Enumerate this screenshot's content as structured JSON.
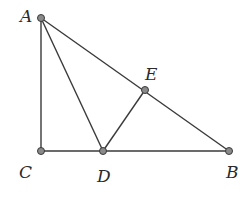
{
  "figure": {
    "type": "geometry-triangle",
    "points": [
      {
        "id": "A",
        "label": "A",
        "x": 41,
        "y": 18,
        "label_x": 20,
        "label_y": 22
      },
      {
        "id": "C",
        "label": "C",
        "x": 41,
        "y": 151,
        "label_x": 19,
        "label_y": 178
      },
      {
        "id": "D",
        "label": "D",
        "x": 103,
        "y": 151,
        "label_x": 97,
        "label_y": 182
      },
      {
        "id": "E",
        "label": "E",
        "x": 145,
        "y": 90,
        "label_x": 145,
        "label_y": 80
      },
      {
        "id": "B",
        "label": "B",
        "x": 229,
        "y": 151,
        "label_x": 226,
        "label_y": 178
      }
    ],
    "segments": [
      [
        "A",
        "C"
      ],
      [
        "C",
        "B"
      ],
      [
        "A",
        "B"
      ],
      [
        "A",
        "D"
      ],
      [
        "D",
        "E"
      ]
    ],
    "colors": {
      "line": "#3a3a3a",
      "point_fill": "#8a8a8a",
      "label": "#2a2a2a"
    }
  }
}
